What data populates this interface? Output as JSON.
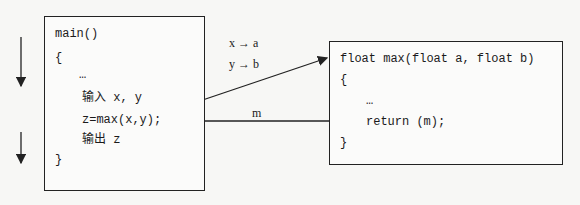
{
  "main_block": {
    "lines": [
      "main()",
      "{",
      "…",
      "输入 x, y",
      "z=max(x,y);",
      "输出 z",
      "}"
    ]
  },
  "max_block": {
    "lines": [
      "float max(float a, float b)",
      "{",
      "…",
      "return (m);",
      "}"
    ]
  },
  "param_mapping": {
    "x": "x → a",
    "y": "y → b"
  },
  "return_label": "m",
  "colors": {
    "line": "#222222",
    "background": "#f7f7f5"
  }
}
